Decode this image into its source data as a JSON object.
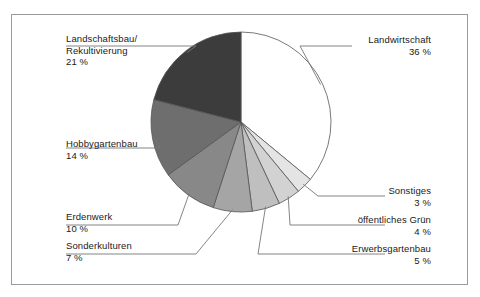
{
  "chart_data": {
    "type": "pie",
    "title": "",
    "unit": "%",
    "legend_position": "callout-labels",
    "center": {
      "x": 241,
      "y": 122
    },
    "radius": 90,
    "start_angle_deg": 0,
    "direction": "clockwise",
    "categories": [
      "Landwirtschaft",
      "Sonstiges",
      "öffentliches Grün",
      "Erwerbsgartenbau",
      "Sonderkulturen",
      "Erdenwerk",
      "Hobbygartenbau",
      "Landschaftsbau/ Rekultivierung"
    ],
    "values": [
      36,
      3,
      4,
      5,
      7,
      10,
      14,
      21
    ],
    "slices": [
      {
        "label": "Landwirtschaft",
        "value": 36,
        "pct_text": "36 %",
        "color": "#ffffff"
      },
      {
        "label": "Sonstiges",
        "value": 3,
        "pct_text": "3 %",
        "color": "#e4e4e4"
      },
      {
        "label": "öffentliches Grün",
        "value": 4,
        "pct_text": "4 %",
        "color": "#d2d2d2"
      },
      {
        "label": "Erwerbsgartenbau",
        "value": 5,
        "pct_text": "5 %",
        "color": "#bfbfbf"
      },
      {
        "label": "Sonderkulturen",
        "value": 7,
        "pct_text": "7 %",
        "color": "#a5a5a5"
      },
      {
        "label": "Erdenwerk",
        "value": 10,
        "pct_text": "10 %",
        "color": "#888888"
      },
      {
        "label": "Hobbygartenbau",
        "value": 14,
        "pct_text": "14 %",
        "color": "#6e6e6e"
      },
      {
        "label": "Landschaftsbau/",
        "value": 21,
        "pct_text": "21 %",
        "color": "#3c3c3c"
      }
    ]
  },
  "labels": {
    "landschaftsbau": {
      "line1": "Landschaftsbau/",
      "line2": "Rekultivierung",
      "pct": "21 %"
    },
    "hobbygartenbau": {
      "name": "Hobbygartenbau",
      "pct": "14 %"
    },
    "erdenwerk": {
      "name": "Erdenwerk",
      "pct": "10 %"
    },
    "sonderkulturen": {
      "name": "Sonderkulturen",
      "pct": "7 %"
    },
    "landwirtschaft": {
      "name": "Landwirtschaft",
      "pct": "36 %"
    },
    "sonstiges": {
      "name": "Sonstiges",
      "pct": "3 %"
    },
    "oeffentliches_gruen": {
      "name": "öffentliches Grün",
      "pct": "4 %"
    },
    "erwerbsgartenbau": {
      "name": "Erwerbsgartenbau",
      "pct": "5 %"
    }
  },
  "style": {
    "slice_outline": "#555555",
    "leader_line": "#777777",
    "frame_border": "#9a9a9a",
    "text_color": "#1a1a1a",
    "background": "#ffffff"
  }
}
